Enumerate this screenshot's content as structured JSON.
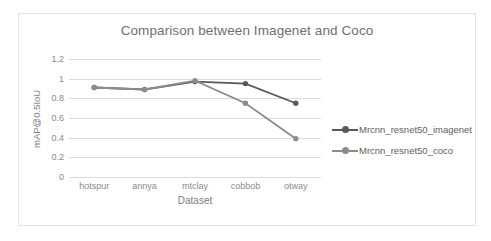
{
  "chart_data": {
    "type": "line",
    "title": "Comparison between Imagenet and Coco",
    "xlabel": "Dataset",
    "ylabel": "mAP@0.5IoU",
    "categories": [
      "hotspur",
      "annya",
      "mtclay",
      "cobbob",
      "otway"
    ],
    "ylim": [
      0,
      1.2
    ],
    "yticks": [
      "0",
      "0.2",
      "0.4",
      "0.6",
      "0.8",
      "1",
      "1.2"
    ],
    "ytick_values": [
      0,
      0.2,
      0.4,
      0.6,
      0.8,
      1,
      1.2
    ],
    "grid": true,
    "legend_position": "right",
    "series": [
      {
        "name": "Mrcnn_resnet50_imagenet",
        "color": "#595959",
        "marker": "circle",
        "values": [
          0.91,
          0.89,
          0.97,
          0.95,
          0.75
        ]
      },
      {
        "name": "Mrcnn_resnet50_coco",
        "color": "#8c8c8c",
        "marker": "circle",
        "values": [
          0.91,
          0.89,
          0.98,
          0.75,
          0.39
        ]
      }
    ]
  },
  "card": {
    "border_color": "#e3e3e3"
  }
}
